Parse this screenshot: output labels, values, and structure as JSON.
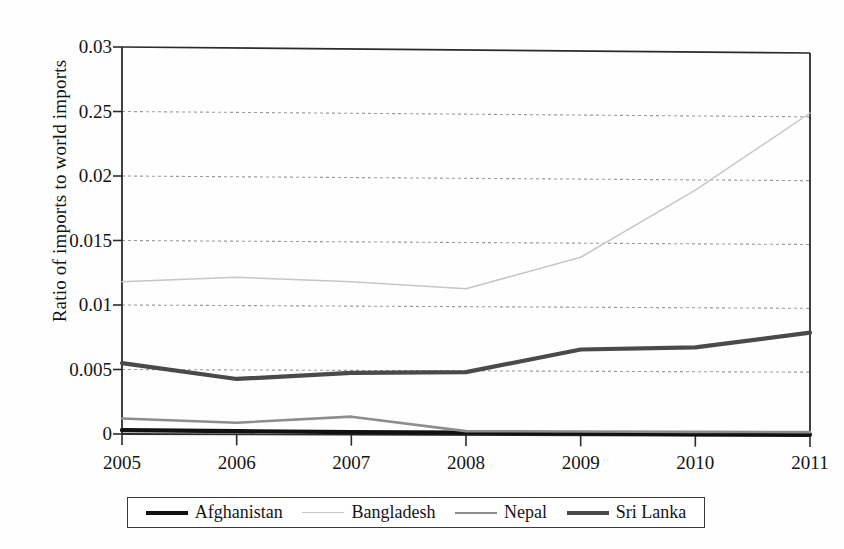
{
  "chart_data": {
    "type": "line",
    "title": "",
    "xlabel": "",
    "ylabel": "Ratio of imports to world imports",
    "x": [
      2005,
      2006,
      2007,
      2008,
      2009,
      2010,
      2011
    ],
    "xtick_labels": [
      "2005",
      "2006",
      "2007",
      "2008",
      "2009",
      "2010",
      "2011"
    ],
    "ytick_labels": [
      "0.03",
      "0.25",
      "0.02",
      "0.015",
      "0.01",
      "0.005",
      "0"
    ],
    "ytick_values": [
      0.03,
      0.025,
      0.02,
      0.015,
      0.01,
      0.005,
      0
    ],
    "ylim": [
      0,
      0.03
    ],
    "xlim": [
      2005,
      2011
    ],
    "grid": "horizontal-dotted",
    "legend_position": "below-plot",
    "series": [
      {
        "name": "Afghanistan",
        "color": "#111111",
        "width": 4.2,
        "dash": "none",
        "values": [
          0.0003,
          0.00025,
          0.0002,
          0.00018,
          0.00015,
          0.00012,
          0.0001
        ]
      },
      {
        "name": "Bangladesh",
        "color": "#c6c6c6",
        "width": 1.5,
        "dash": "none",
        "values": [
          0.0118,
          0.0122,
          0.0119,
          0.0114,
          0.0139,
          0.0192,
          0.0253
        ]
      },
      {
        "name": "Nepal",
        "color": "#8d8d8d",
        "width": 2.6,
        "dash": "none",
        "values": [
          0.0012,
          0.0009,
          0.0014,
          0.0003,
          0.0003,
          0.0003,
          0.0003
        ]
      },
      {
        "name": "Sri Lanka",
        "color": "#4a4a4a",
        "width": 4.2,
        "dash": "none",
        "values": [
          0.0055,
          0.0043,
          0.0048,
          0.0049,
          0.0067,
          0.0069,
          0.0081
        ]
      }
    ]
  },
  "legend": {
    "items": [
      {
        "label": "Afghanistan",
        "color": "#111111",
        "width": 4.2
      },
      {
        "label": "Bangladesh",
        "color": "#c6c6c6",
        "width": 1.6
      },
      {
        "label": "Nepal",
        "color": "#8d8d8d",
        "width": 2.6
      },
      {
        "label": "Sri Lanka",
        "color": "#4a4a4a",
        "width": 4.0
      }
    ]
  },
  "axis": {
    "y_title": "Ratio of imports to world imports"
  }
}
